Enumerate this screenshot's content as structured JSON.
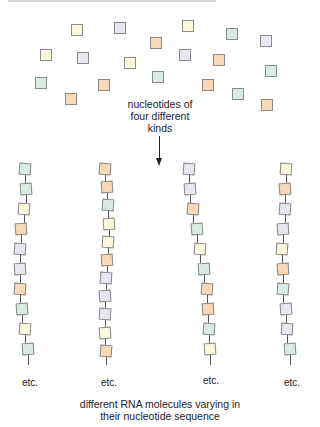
{
  "colors": {
    "yellow": "#fdf9dc",
    "orange": "#f9d9b8",
    "green": "#d8ece2",
    "lavender": "#e7e7f1",
    "outline": "#8a8a8a"
  },
  "free_label": [
    "nucleotides of",
    "four different",
    "kinds"
  ],
  "free_nucleotides": [
    {
      "x": 71,
      "y": 24,
      "c": "yellow"
    },
    {
      "x": 114,
      "y": 22,
      "c": "lav"
    },
    {
      "x": 182,
      "y": 20,
      "c": "yellow"
    },
    {
      "x": 226,
      "y": 28,
      "c": "green"
    },
    {
      "x": 260,
      "y": 35,
      "c": "lav"
    },
    {
      "x": 150,
      "y": 37,
      "c": "orange"
    },
    {
      "x": 40,
      "y": 49,
      "c": "yellow"
    },
    {
      "x": 77,
      "y": 52,
      "c": "lav"
    },
    {
      "x": 124,
      "y": 57,
      "c": "yellow"
    },
    {
      "x": 179,
      "y": 49,
      "c": "lav"
    },
    {
      "x": 213,
      "y": 54,
      "c": "orange"
    },
    {
      "x": 265,
      "y": 65,
      "c": "green"
    },
    {
      "x": 35,
      "y": 77,
      "c": "green"
    },
    {
      "x": 98,
      "y": 79,
      "c": "orange"
    },
    {
      "x": 152,
      "y": 71,
      "c": "green"
    },
    {
      "x": 202,
      "y": 79,
      "c": "orange"
    },
    {
      "x": 65,
      "y": 93,
      "c": "orange"
    },
    {
      "x": 232,
      "y": 88,
      "c": "green"
    },
    {
      "x": 261,
      "y": 99,
      "c": "orange"
    }
  ],
  "chains": [
    {
      "x": [
        25,
        26,
        24,
        21,
        20,
        20,
        20,
        22,
        25,
        28
      ],
      "seq": [
        "green",
        "green",
        "yellow",
        "orange",
        "lav",
        "lav",
        "orange",
        "green",
        "yellow",
        "green"
      ],
      "etc": "etc."
    },
    {
      "x": [
        105,
        107,
        108,
        109,
        108,
        107,
        106,
        105,
        105,
        105,
        106
      ],
      "seq": [
        "orange",
        "orange",
        "green",
        "yellow",
        "yellow",
        "orange",
        "lav",
        "lav",
        "lav",
        "yellow",
        "orange"
      ],
      "etc": "etc."
    },
    {
      "x": [
        189,
        190,
        193,
        197,
        200,
        204,
        207,
        208,
        209,
        210
      ],
      "seq": [
        "lav",
        "lav",
        "orange",
        "green",
        "yellow",
        "green",
        "orange",
        "orange",
        "green",
        "yellow"
      ],
      "etc": "etc."
    },
    {
      "x": [
        286,
        285,
        285,
        283,
        282,
        283,
        283,
        286,
        287,
        290
      ],
      "seq": [
        "yellow",
        "orange",
        "lav",
        "lav",
        "yellow",
        "orange",
        "green",
        "lav",
        "lav",
        "green"
      ],
      "etc": "etc."
    }
  ],
  "caption": [
    "different RNA molecules varying in",
    "their nucleotide sequence"
  ]
}
